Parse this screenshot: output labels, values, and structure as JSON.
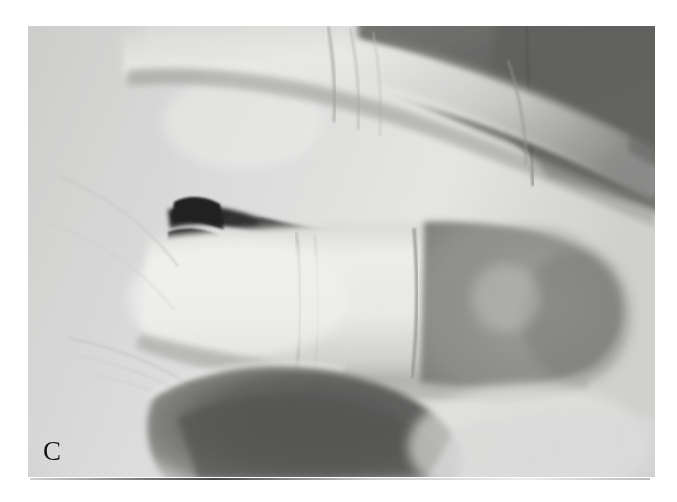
{
  "figure": {
    "panel_label": "C",
    "caption_ghost": "",
    "background_color": "#ffffff"
  },
  "photo": {
    "alt": "Grayscale clinical photograph of a hand viewed from the side showing two adjacent fingers, the lower fingertip appearing darkened and discolored",
    "subject": "hand-fingers",
    "modality": "photograph",
    "color_mode": "grayscale",
    "colors": {
      "highlight_skin": "#f2f2f0",
      "mid_skin": "#c9c9c7",
      "shadow_skin": "#8d8d8b",
      "deep_shadow": "#4b4b4a",
      "darkest": "#1d1d1d",
      "plate_border": "#ffffff"
    },
    "geometry": {
      "left": 28,
      "top": 26,
      "width": 627,
      "height": 451
    },
    "regions": [
      {
        "name": "upper-finger",
        "description": "index finger extending to upper right with knuckle creases"
      },
      {
        "name": "lower-finger",
        "description": "middle finger extending right with rounded, darkened distal pad"
      },
      {
        "name": "darkened-fingertip",
        "description": "discolored dusky distal phalanx of lower finger"
      },
      {
        "name": "web-space",
        "description": "dark interdigital cleft between the two fingers"
      },
      {
        "name": "palm",
        "description": "bright palmar skin at left"
      },
      {
        "name": "thumb-shadow",
        "description": "dark curved shadow of thumb at lower left"
      },
      {
        "name": "background-shadow",
        "description": "dark background band at upper right"
      }
    ]
  }
}
